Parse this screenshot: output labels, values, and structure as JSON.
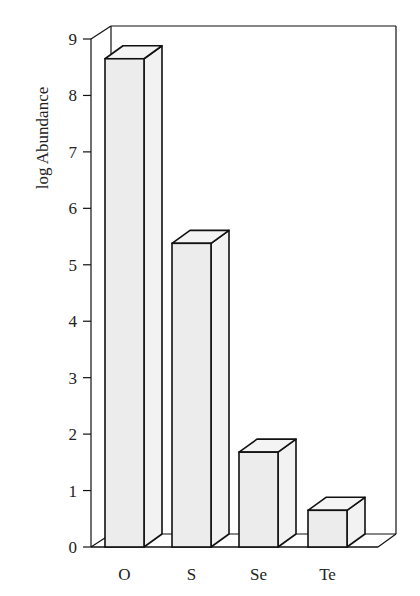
{
  "chart_data": {
    "type": "bar",
    "style": "3d",
    "title": "",
    "xlabel": "",
    "ylabel": "log Abundance",
    "categories": [
      "O",
      "S",
      "Se",
      "Te"
    ],
    "values": [
      8.65,
      5.38,
      1.68,
      0.65
    ],
    "ylim": [
      0,
      9
    ],
    "yticks": [
      0,
      1,
      2,
      3,
      4,
      5,
      6,
      7,
      8,
      9
    ],
    "grid": false,
    "legend": null,
    "colors": {
      "bar_face": "#ececec",
      "bar_side": "#f2f2f2",
      "bar_top": "#f4f4f4",
      "outline": "#111111"
    }
  }
}
